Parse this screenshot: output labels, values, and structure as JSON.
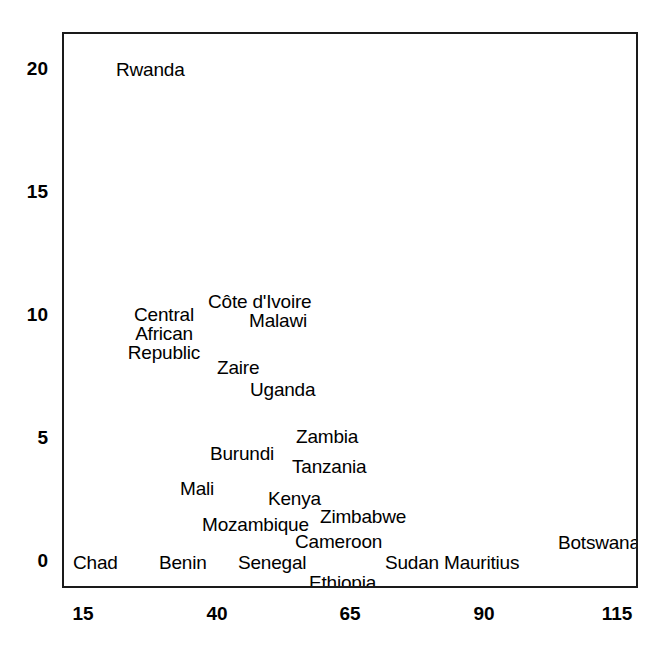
{
  "chart_data": {
    "type": "scatter",
    "title": "",
    "subtitle": "",
    "xlabel": "",
    "ylabel": "",
    "xlim": [
      11,
      115
    ],
    "ylim": [
      -0.6,
      21.4
    ],
    "grid": false,
    "legend": null,
    "marker_style": "text-label-only",
    "xticks": [
      15,
      40,
      65,
      90,
      115
    ],
    "yticks": [
      0,
      5,
      10,
      15,
      20
    ],
    "xtick_labels": [
      "15",
      "40",
      "65",
      "90",
      "115"
    ],
    "ytick_labels": [
      "0",
      "5",
      "10",
      "15",
      "20"
    ],
    "points": [
      {
        "label": "Rwanda",
        "x": 24.7,
        "y": 20.0,
        "px": 114,
        "py": 58,
        "align": "left",
        "lines": [
          "Rwanda"
        ]
      },
      {
        "label": "Côte d'Ivoire",
        "x": 41.9,
        "y": 10.5,
        "px": 206,
        "py": 290,
        "align": "left",
        "lines": [
          "Côte d'Ivoire"
        ]
      },
      {
        "label": "Malawi",
        "x": 49.5,
        "y": 9.8,
        "px": 247,
        "py": 309,
        "align": "left",
        "lines": [
          "Malawi"
        ]
      },
      {
        "label": "Central African Republic",
        "x": 29.2,
        "y": 9.6,
        "px": 120,
        "py": 303,
        "align": "center",
        "lines": [
          "Central",
          "African",
          "Republic"
        ]
      },
      {
        "label": "Zaire",
        "x": 44.0,
        "y": 8.0,
        "px": 215,
        "py": 356,
        "align": "left",
        "lines": [
          "Zaire"
        ]
      },
      {
        "label": "Uganda",
        "x": 50.0,
        "y": 7.1,
        "px": 248,
        "py": 378,
        "align": "left",
        "lines": [
          "Uganda"
        ]
      },
      {
        "label": "Zambia",
        "x": 57.0,
        "y": 5.2,
        "px": 294,
        "py": 425,
        "align": "left",
        "lines": [
          "Zambia"
        ]
      },
      {
        "label": "Burundi",
        "x": 42.5,
        "y": 4.7,
        "px": 208,
        "py": 442,
        "align": "left",
        "lines": [
          "Burundi"
        ]
      },
      {
        "label": "Tanzania",
        "x": 57.5,
        "y": 4.0,
        "px": 290,
        "py": 455,
        "align": "left",
        "lines": [
          "Tanzania"
        ]
      },
      {
        "label": "Mali",
        "x": 36.5,
        "y": 3.3,
        "px": 178,
        "py": 477,
        "align": "left",
        "lines": [
          "Mali"
        ]
      },
      {
        "label": "Kenya",
        "x": 52.0,
        "y": 2.6,
        "px": 266,
        "py": 487,
        "align": "left",
        "lines": [
          "Kenya"
        ]
      },
      {
        "label": "Zimbabwe",
        "x": 62.0,
        "y": 2.2,
        "px": 318,
        "py": 505,
        "align": "left",
        "lines": [
          "Zimbabwe"
        ]
      },
      {
        "label": "Mozambique",
        "x": 42.0,
        "y": 1.7,
        "px": 200,
        "py": 513,
        "align": "left",
        "lines": [
          "Mozambique"
        ]
      },
      {
        "label": "Cameroon",
        "x": 57.0,
        "y": 0.9,
        "px": 293,
        "py": 530,
        "align": "left",
        "lines": [
          "Cameroon"
        ]
      },
      {
        "label": "Botswana",
        "x": 107.0,
        "y": 0.6,
        "px": 556,
        "py": 531,
        "align": "left",
        "lines": [
          "Botswana"
        ]
      },
      {
        "label": "Chad",
        "x": 17.0,
        "y": 0.0,
        "px": 71,
        "py": 551,
        "align": "left",
        "lines": [
          "Chad"
        ]
      },
      {
        "label": "Benin",
        "x": 33.0,
        "y": 0.0,
        "px": 157,
        "py": 551,
        "align": "left",
        "lines": [
          "Benin"
        ]
      },
      {
        "label": "Senegal",
        "x": 47.5,
        "y": 0.0,
        "px": 236,
        "py": 551,
        "align": "left",
        "lines": [
          "Senegal"
        ]
      },
      {
        "label": "Sudan",
        "x": 76.5,
        "y": 0.0,
        "px": 383,
        "py": 551,
        "align": "left",
        "lines": [
          "Sudan"
        ]
      },
      {
        "label": "Mauritius",
        "x": 87.5,
        "y": 0.0,
        "px": 442,
        "py": 551,
        "align": "left",
        "lines": [
          "Mauritius"
        ]
      },
      {
        "label": "Ethiopia",
        "x": 61.0,
        "y": -0.6,
        "px": 307,
        "py": 571,
        "align": "left",
        "lines": [
          "Ethiopia"
        ]
      }
    ]
  },
  "axes": {
    "x_ticks": [
      {
        "text": "15",
        "px": 83
      },
      {
        "text": "40",
        "px": 217
      },
      {
        "text": "65",
        "px": 350
      },
      {
        "text": "90",
        "px": 484
      },
      {
        "text": "115",
        "px": 617
      }
    ],
    "y_ticks": [
      {
        "text": "20",
        "py": 59
      },
      {
        "text": "15",
        "py": 182
      },
      {
        "text": "10",
        "py": 305
      },
      {
        "text": "5",
        "py": 428
      },
      {
        "text": "0",
        "py": 551
      }
    ]
  },
  "style": {
    "frame_color": "#1a1a1a",
    "text_color": "#000000",
    "background": "#ffffff"
  }
}
